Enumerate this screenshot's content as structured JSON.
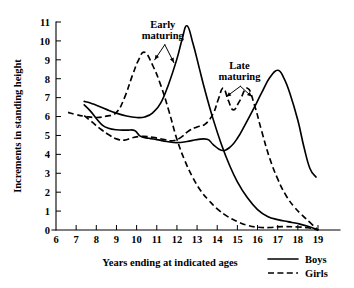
{
  "chart_data": {
    "type": "line",
    "title": "",
    "xlabel": "Years ending at indicated ages",
    "ylabel": "Increments in standing height",
    "xlim": [
      6,
      19
    ],
    "ylim": [
      0,
      11
    ],
    "xticks": [
      "6",
      "7",
      "8",
      "9",
      "10",
      "11",
      "12",
      "13",
      "14",
      "15",
      "16",
      "17",
      "18",
      "19"
    ],
    "yticks": [
      "0",
      "1",
      "2",
      "3",
      "4",
      "5",
      "6",
      "7",
      "8",
      "9",
      "10",
      "11"
    ],
    "grid": false,
    "legend_position": "bottom-right",
    "legend": [
      {
        "label": "Boys",
        "style": "solid"
      },
      {
        "label": "Girls",
        "style": "dashed"
      }
    ],
    "annotations": [
      {
        "text_line1": "Early",
        "text_line2": "maturing",
        "x": 11.3,
        "y": 10.7
      },
      {
        "text_line1": "Late",
        "text_line2": "maturing",
        "x": 15.1,
        "y": 8.5
      }
    ],
    "series": [
      {
        "name": "Early maturing Boys",
        "group": "Early maturing",
        "sex": "Boys",
        "style": "solid",
        "peak_age": 12.5,
        "peak_value": 10.8,
        "points": [
          [
            7.4,
            6.8
          ],
          [
            7.7,
            6.72
          ],
          [
            8.0,
            6.6
          ],
          [
            8.5,
            6.38
          ],
          [
            9.0,
            6.18
          ],
          [
            9.5,
            6.03
          ],
          [
            10.0,
            5.95
          ],
          [
            10.4,
            5.98
          ],
          [
            10.8,
            6.2
          ],
          [
            11.2,
            6.72
          ],
          [
            11.6,
            7.75
          ],
          [
            12.0,
            9.05
          ],
          [
            12.25,
            10.05
          ],
          [
            12.5,
            10.8
          ],
          [
            12.8,
            9.85
          ],
          [
            13.1,
            8.6
          ],
          [
            13.4,
            7.35
          ],
          [
            13.8,
            5.85
          ],
          [
            14.2,
            4.55
          ],
          [
            14.6,
            3.45
          ],
          [
            15.0,
            2.55
          ],
          [
            15.5,
            1.7
          ],
          [
            16.0,
            1.08
          ],
          [
            16.5,
            0.72
          ],
          [
            17.0,
            0.55
          ],
          [
            17.5,
            0.44
          ],
          [
            18.0,
            0.34
          ],
          [
            18.5,
            0.2
          ],
          [
            19.0,
            0.0
          ]
        ]
      },
      {
        "name": "Early maturing Girls",
        "group": "Early maturing",
        "sex": "Girls",
        "style": "dashed",
        "peak_age": 10.4,
        "peak_value": 9.4,
        "points": [
          [
            6.6,
            6.22
          ],
          [
            7.0,
            6.1
          ],
          [
            7.5,
            6.0
          ],
          [
            8.0,
            5.95
          ],
          [
            8.5,
            6.02
          ],
          [
            9.0,
            6.22
          ],
          [
            9.4,
            7.0
          ],
          [
            9.8,
            8.2
          ],
          [
            10.1,
            9.0
          ],
          [
            10.4,
            9.4
          ],
          [
            10.8,
            8.7
          ],
          [
            11.2,
            7.65
          ],
          [
            11.6,
            6.3
          ],
          [
            12.0,
            4.8
          ],
          [
            12.4,
            3.65
          ],
          [
            12.8,
            2.75
          ],
          [
            13.2,
            2.05
          ],
          [
            13.6,
            1.55
          ],
          [
            14.0,
            1.12
          ],
          [
            14.5,
            0.72
          ],
          [
            15.0,
            0.45
          ],
          [
            15.5,
            0.25
          ],
          [
            16.0,
            0.15
          ],
          [
            16.6,
            0.13
          ],
          [
            17.2,
            0.18
          ],
          [
            18.0,
            0.16
          ],
          [
            18.5,
            0.12
          ],
          [
            19.0,
            0.0
          ]
        ]
      },
      {
        "name": "Late maturing Boys",
        "group": "Late maturing",
        "sex": "Boys",
        "style": "solid",
        "peak_age": 17.0,
        "peak_value": 8.45,
        "points": [
          [
            7.4,
            6.62
          ],
          [
            7.7,
            6.3
          ],
          [
            8.0,
            5.9
          ],
          [
            8.3,
            5.55
          ],
          [
            8.6,
            5.38
          ],
          [
            9.0,
            5.3
          ],
          [
            9.5,
            5.28
          ],
          [
            9.9,
            5.26
          ],
          [
            10.2,
            4.95
          ],
          [
            10.6,
            4.85
          ],
          [
            11.0,
            4.78
          ],
          [
            11.5,
            4.68
          ],
          [
            12.0,
            4.62
          ],
          [
            12.5,
            4.68
          ],
          [
            13.0,
            4.78
          ],
          [
            13.5,
            4.8
          ],
          [
            13.8,
            4.52
          ],
          [
            14.2,
            4.22
          ],
          [
            14.6,
            4.35
          ],
          [
            15.0,
            4.85
          ],
          [
            15.4,
            5.6
          ],
          [
            15.8,
            6.4
          ],
          [
            16.2,
            7.25
          ],
          [
            16.6,
            8.05
          ],
          [
            17.0,
            8.45
          ],
          [
            17.3,
            8.05
          ],
          [
            17.6,
            7.25
          ],
          [
            18.0,
            5.8
          ],
          [
            18.3,
            4.4
          ],
          [
            18.6,
            3.25
          ],
          [
            18.9,
            2.8
          ]
        ]
      },
      {
        "name": "Late maturing Girls",
        "group": "Late maturing",
        "sex": "Girls",
        "style": "dashed",
        "peak_age": 14.3,
        "peak_value": 7.5,
        "points": [
          [
            7.4,
            6.05
          ],
          [
            7.8,
            5.7
          ],
          [
            8.2,
            5.35
          ],
          [
            8.6,
            5.05
          ],
          [
            9.0,
            4.82
          ],
          [
            9.4,
            4.75
          ],
          [
            9.8,
            4.88
          ],
          [
            10.3,
            4.95
          ],
          [
            10.8,
            4.9
          ],
          [
            11.3,
            4.8
          ],
          [
            11.8,
            4.72
          ],
          [
            12.2,
            4.9
          ],
          [
            12.6,
            5.25
          ],
          [
            13.0,
            5.45
          ],
          [
            13.4,
            5.6
          ],
          [
            13.8,
            6.15
          ],
          [
            14.05,
            6.9
          ],
          [
            14.3,
            7.5
          ],
          [
            14.55,
            6.85
          ],
          [
            14.8,
            6.35
          ],
          [
            15.1,
            6.8
          ],
          [
            15.5,
            7.5
          ],
          [
            15.85,
            6.6
          ],
          [
            16.2,
            5.25
          ],
          [
            16.6,
            3.8
          ],
          [
            17.0,
            2.7
          ],
          [
            17.4,
            1.85
          ],
          [
            17.8,
            1.25
          ],
          [
            18.2,
            0.8
          ],
          [
            18.6,
            0.4
          ],
          [
            19.0,
            0.0
          ]
        ]
      }
    ]
  }
}
